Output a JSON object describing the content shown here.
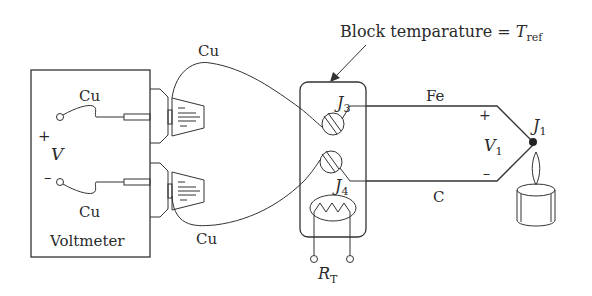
{
  "diagram": {
    "title_annotation": {
      "text_prefix": "Block temparature = ",
      "symbol": "T",
      "subscript": "ref"
    },
    "voltmeter": {
      "label": "Voltmeter",
      "voltage_symbol": "V",
      "plus": "+",
      "minus": "–",
      "top_wire_label": "Cu",
      "bottom_wire_label": "Cu"
    },
    "leads": {
      "upper_label": "Cu",
      "lower_label": "Cu"
    },
    "block": {
      "junction_upper": {
        "symbol": "J",
        "subscript": "3"
      },
      "junction_lower": {
        "symbol": "J",
        "subscript": "4"
      },
      "thermistor": {
        "symbol": "R",
        "subscript": "T"
      }
    },
    "thermocouple": {
      "upper_wire_label": "Fe",
      "lower_wire_label": "C",
      "plus": "+",
      "minus": "–",
      "voltage": {
        "symbol": "V",
        "subscript": "1"
      },
      "hot_junction": {
        "symbol": "J",
        "subscript": "1"
      }
    },
    "heat_source": "candle-flame"
  }
}
